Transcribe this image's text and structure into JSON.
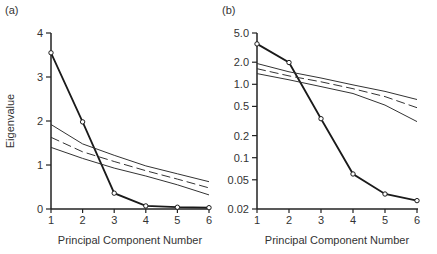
{
  "chart_data": [
    {
      "panel_label": "(a)",
      "type": "line",
      "xlabel": "Principal Component Number",
      "ylabel": "Eigenvalue",
      "yscale": "linear",
      "ylim": [
        0,
        4
      ],
      "x": [
        1,
        2,
        3,
        4,
        5,
        6
      ],
      "xticks": [
        "1",
        "2",
        "3",
        "4",
        "5",
        "6"
      ],
      "yticks": [
        "0",
        "1",
        "2",
        "3",
        "4"
      ],
      "grid": false,
      "series": [
        {
          "name": "Eigenvalues",
          "style": "solid-bold-markers",
          "values": [
            3.55,
            1.98,
            0.36,
            0.07,
            0.04,
            0.03
          ]
        },
        {
          "name": "Upper bound",
          "style": "solid",
          "values": [
            1.92,
            1.48,
            1.22,
            0.98,
            0.8,
            0.62
          ]
        },
        {
          "name": "Mean",
          "style": "dashed",
          "values": [
            1.63,
            1.3,
            1.08,
            0.87,
            0.68,
            0.48
          ]
        },
        {
          "name": "Lower bound",
          "style": "solid",
          "values": [
            1.4,
            1.15,
            0.93,
            0.75,
            0.55,
            0.32
          ]
        }
      ]
    },
    {
      "panel_label": "(b)",
      "type": "line",
      "xlabel": "Principal Component Number",
      "ylabel": "",
      "yscale": "log",
      "ylim": [
        0.02,
        5.0
      ],
      "x": [
        1,
        2,
        3,
        4,
        5,
        6
      ],
      "xticks": [
        "1",
        "2",
        "3",
        "4",
        "5",
        "6"
      ],
      "yticks": [
        "0.02",
        "0.05",
        "0.1",
        "0.2",
        "0.5",
        "1.0",
        "2.0",
        "5.0"
      ],
      "grid": false,
      "series": [
        {
          "name": "Eigenvalues",
          "style": "solid-bold-markers",
          "values": [
            3.55,
            1.98,
            0.34,
            0.06,
            0.032,
            0.026
          ]
        },
        {
          "name": "Upper bound",
          "style": "solid",
          "values": [
            1.92,
            1.48,
            1.22,
            0.98,
            0.8,
            0.62
          ]
        },
        {
          "name": "Mean",
          "style": "dashed",
          "values": [
            1.63,
            1.3,
            1.08,
            0.87,
            0.68,
            0.48
          ]
        },
        {
          "name": "Lower bound",
          "style": "solid",
          "values": [
            1.4,
            1.15,
            0.93,
            0.75,
            0.52,
            0.31
          ]
        }
      ]
    }
  ]
}
